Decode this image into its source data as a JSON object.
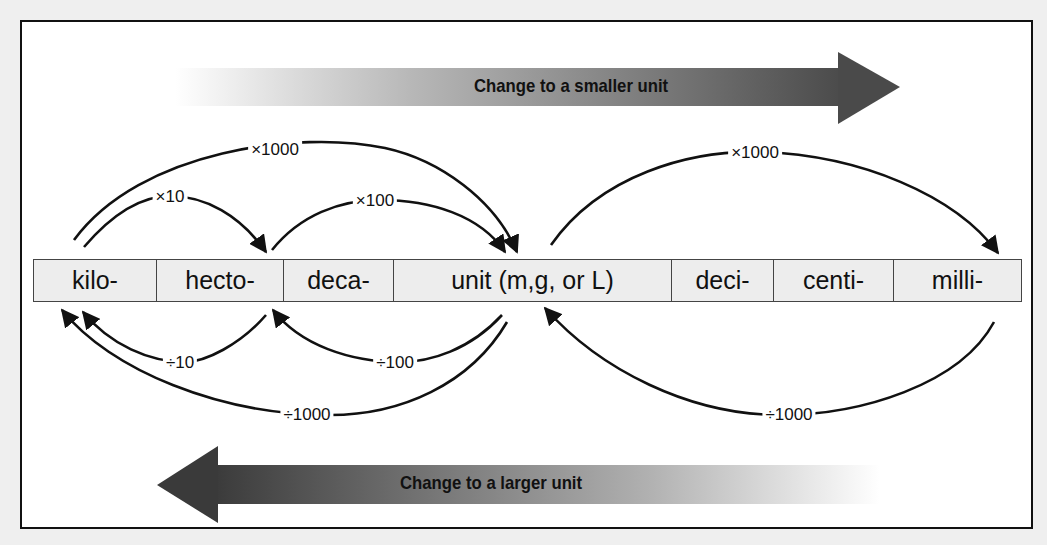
{
  "banners": {
    "top": {
      "label": "Change to a smaller unit",
      "direction": "right"
    },
    "bottom": {
      "label": "Change to a larger unit",
      "direction": "left"
    }
  },
  "units": [
    {
      "label": "kilo-",
      "width": 123
    },
    {
      "label": "hecto-",
      "width": 127
    },
    {
      "label": "deca-",
      "width": 110
    },
    {
      "label": "unit (m,g, or L)",
      "width": 278
    },
    {
      "label": "deci-",
      "width": 102
    },
    {
      "label": "centi-",
      "width": 120
    },
    {
      "label": "milli-",
      "width": 127
    }
  ],
  "multiply_arcs": [
    {
      "label": "×1000",
      "from": "kilo-",
      "to": "unit (m,g, or L)"
    },
    {
      "label": "×10",
      "from": "kilo-",
      "to": "hecto-"
    },
    {
      "label": "×100",
      "from": "hecto-",
      "to": "unit (m,g, or L)"
    },
    {
      "label": "×1000",
      "from": "unit (m,g, or L)",
      "to": "milli-"
    }
  ],
  "divide_arcs": [
    {
      "label": "÷10",
      "from": "hecto-",
      "to": "kilo-"
    },
    {
      "label": "÷100",
      "from": "unit (m,g, or L)",
      "to": "hecto-"
    },
    {
      "label": "÷1000",
      "from": "unit (m,g, or L)",
      "to": "kilo-"
    },
    {
      "label": "÷1000",
      "from": "milli-",
      "to": "unit (m,g, or L)"
    }
  ],
  "colors": {
    "arrow_dark": "#3a3a3a",
    "arrow_light": "#ffffff",
    "cell_bg": "#ededed",
    "frame": "#111111"
  }
}
